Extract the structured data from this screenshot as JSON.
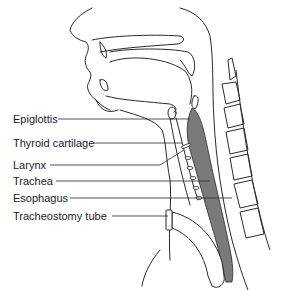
{
  "diagram": {
    "colors": {
      "line": "#2a2a2a",
      "shade": "#7a7a7a",
      "background": "#ffffff"
    },
    "labels": [
      {
        "id": "epiglottis",
        "text": "Epiglottis",
        "x": 13,
        "y": 113
      },
      {
        "id": "thyroid-cartilage",
        "text": "Thyroid cartilage",
        "x": 13,
        "y": 137
      },
      {
        "id": "larynx",
        "text": "Larynx",
        "x": 13,
        "y": 159
      },
      {
        "id": "trachea",
        "text": "Trachea",
        "x": 13,
        "y": 175
      },
      {
        "id": "esophagus",
        "text": "Esophagus",
        "x": 13,
        "y": 192
      },
      {
        "id": "tracheostomy-tube",
        "text": "Tracheostomy tube",
        "x": 13,
        "y": 210
      }
    ]
  }
}
